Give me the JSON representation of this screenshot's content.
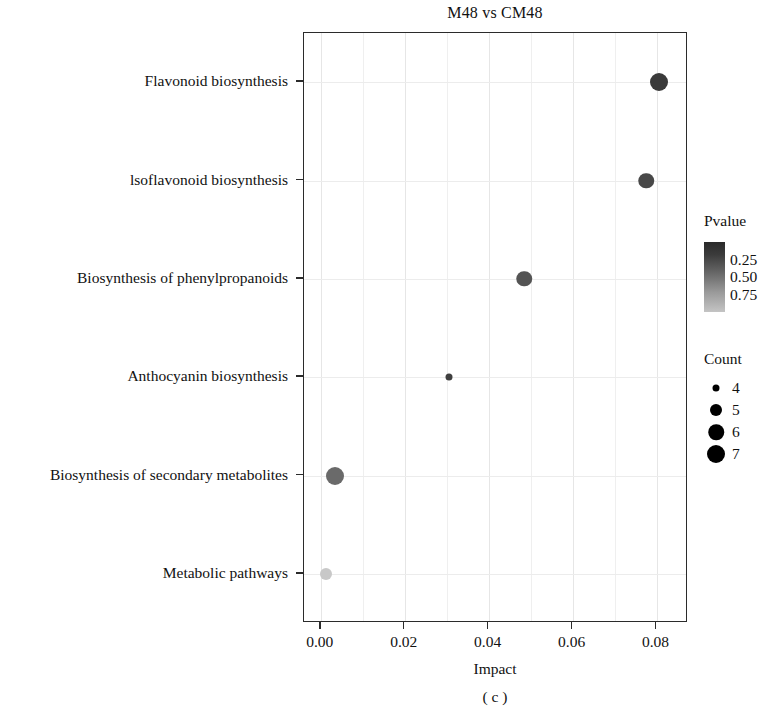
{
  "chart_data": {
    "type": "scatter",
    "title": "M48 vs CM48",
    "caption": "( c )",
    "xlabel": "Impact",
    "ylabel": "",
    "xlim": [
      -0.004,
      0.0875
    ],
    "xticks": [
      0.0,
      0.02,
      0.04,
      0.06,
      0.08
    ],
    "xtick_labels": [
      "0.00",
      "0.02",
      "0.04",
      "0.06",
      "0.08"
    ],
    "categories": [
      "Flavonoid biosynthesis",
      "lsoflavonoid biosynthesis",
      "Biosynthesis of phenylpropanoids",
      "Anthocyanin biosynthesis",
      "Biosynthesis of secondary metabolites",
      "Metabolic pathways"
    ],
    "grid": true,
    "legend_position": "right",
    "points": [
      {
        "pathway": "Flavonoid biosynthesis",
        "impact": 0.0805,
        "pvalue": 0.12,
        "count": 7,
        "color": "#3a3a3a"
      },
      {
        "pathway": "lsoflavonoid biosynthesis",
        "impact": 0.0775,
        "pvalue": 0.22,
        "count": 6,
        "color": "#484848"
      },
      {
        "pathway": "Biosynthesis of phenylpropanoids",
        "impact": 0.0485,
        "pvalue": 0.3,
        "count": 6,
        "color": "#545454"
      },
      {
        "pathway": "Anthocyanin biosynthesis",
        "impact": 0.0305,
        "pvalue": 0.35,
        "count": 4,
        "color": "#3f3f3f"
      },
      {
        "pathway": "Biosynthesis of secondary metabolites",
        "impact": 0.0035,
        "pvalue": 0.45,
        "count": 7,
        "color": "#6a6a6a"
      },
      {
        "pathway": "Metabolic pathways",
        "impact": 0.0012,
        "pvalue": 0.88,
        "count": 5,
        "color": "#c8c8c8"
      }
    ],
    "pvalue_legend": {
      "title": "Pvalue",
      "ticks": [
        0.25,
        0.5,
        0.75
      ],
      "tick_labels": [
        "0.25",
        "0.50",
        "0.75"
      ],
      "gradient_dark": "#2a2a2a",
      "gradient_light": "#c4c4c4"
    },
    "count_legend": {
      "title": "Count",
      "values": [
        4,
        5,
        6,
        7
      ],
      "value_labels": [
        "4",
        "5",
        "6",
        "7"
      ],
      "dot_color": "#000000"
    }
  }
}
